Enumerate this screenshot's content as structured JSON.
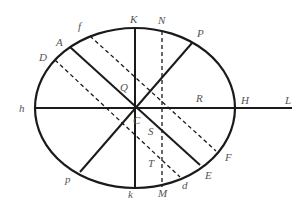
{
  "diagram": {
    "type": "geometric-ellipse-construction",
    "colors": {
      "stroke": "#1a1a1a",
      "label": "#555555",
      "background": "#ffffff"
    },
    "ellipse": {
      "cx": 135,
      "cy": 108,
      "rx": 100,
      "ry": 80
    },
    "lines": [
      {
        "name": "axis-h-L",
        "from": "h",
        "to": "L",
        "style": "solid",
        "x1": 35,
        "y1": 108,
        "x2": 292,
        "y2": 108
      },
      {
        "name": "axis-K-k",
        "from": "K",
        "to": "k",
        "style": "solid",
        "x1": 135,
        "y1": 28,
        "x2": 135,
        "y2": 188
      },
      {
        "name": "diameter-P-p",
        "from": "P",
        "to": "p",
        "style": "solid",
        "x1": 192,
        "y1": 43,
        "x2": 80,
        "y2": 172
      },
      {
        "name": "diameter-A-E",
        "from": "A",
        "to": "E",
        "style": "solid",
        "x1": 70,
        "y1": 47,
        "x2": 200,
        "y2": 165
      },
      {
        "name": "chord-f-F",
        "from": "f",
        "to": "F",
        "style": "dashed",
        "x1": 90,
        "y1": 36,
        "x2": 216,
        "y2": 151
      },
      {
        "name": "chord-D-d",
        "from": "D",
        "to": "d",
        "style": "dashed",
        "x1": 55,
        "y1": 60,
        "x2": 180,
        "y2": 177
      },
      {
        "name": "ordinate-N-M",
        "from": "N",
        "to": "M",
        "style": "dashed",
        "x1": 162,
        "y1": 31,
        "x2": 162,
        "y2": 187
      }
    ],
    "labels": [
      {
        "text": "K",
        "x": 130,
        "y": 23
      },
      {
        "text": "N",
        "x": 158,
        "y": 24
      },
      {
        "text": "P",
        "x": 197,
        "y": 37
      },
      {
        "text": "f",
        "x": 78,
        "y": 30
      },
      {
        "text": "A",
        "x": 56,
        "y": 46
      },
      {
        "text": "D",
        "x": 39,
        "y": 61
      },
      {
        "text": "Q",
        "x": 120,
        "y": 91
      },
      {
        "text": "R",
        "x": 196,
        "y": 102
      },
      {
        "text": "h",
        "x": 19,
        "y": 112
      },
      {
        "text": "H",
        "x": 241,
        "y": 104
      },
      {
        "text": "L",
        "x": 285,
        "y": 104
      },
      {
        "text": "C",
        "x": 133,
        "y": 124
      },
      {
        "text": "S",
        "x": 148,
        "y": 135
      },
      {
        "text": "T",
        "x": 148,
        "y": 167
      },
      {
        "text": "p",
        "x": 65,
        "y": 183
      },
      {
        "text": "k",
        "x": 128,
        "y": 198
      },
      {
        "text": "M",
        "x": 158,
        "y": 197
      },
      {
        "text": "d",
        "x": 182,
        "y": 189
      },
      {
        "text": "E",
        "x": 205,
        "y": 179
      },
      {
        "text": "F",
        "x": 225,
        "y": 161
      }
    ]
  }
}
